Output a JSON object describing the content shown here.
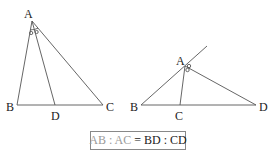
{
  "figure_left": {
    "labels": {
      "A": "A",
      "B": "B",
      "C": "C",
      "D": "D"
    },
    "description": "Internal angle bisector AD of triangle ABC"
  },
  "figure_right": {
    "labels": {
      "A": "A",
      "B": "B",
      "C": "C",
      "D": "D"
    },
    "description": "External angle bisector AD of triangle ABC"
  },
  "formula": {
    "left_part": "AB : AC",
    "equals": "=",
    "right_part": "BD : CD"
  },
  "colors": {
    "line": "#555555",
    "label": "#222222",
    "formula_light": "#9a9a9a",
    "box_border": "#888888"
  }
}
